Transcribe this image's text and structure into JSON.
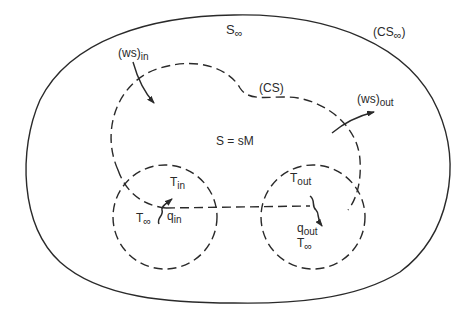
{
  "diagram": {
    "type": "control-surface-thermodynamics",
    "labels": {
      "s_inf": {
        "main": "S",
        "sub": "∞"
      },
      "cs_inf": {
        "open": "(CS",
        "sub": "∞",
        "close": ")"
      },
      "ws_in": {
        "main": "(ws)",
        "sub": "in"
      },
      "cs": "(CS)",
      "ws_out": {
        "main": "(ws)",
        "sub": "out"
      },
      "s_eq": "S = sM",
      "t_in": {
        "main": "T",
        "sub": "in"
      },
      "t_inf_left": {
        "main": "T",
        "sub": "∞"
      },
      "q_in": {
        "main": "q",
        "sub": "in"
      },
      "t_out": {
        "main": "T",
        "sub": "out"
      },
      "q_out": {
        "main": "q",
        "sub": "out"
      },
      "t_inf_right": {
        "main": "T",
        "sub": "∞"
      }
    },
    "elements": {
      "outer_boundary": "CS∞ (solid)",
      "control_surface": "CS (dashed)",
      "inlet_circle": "dashed circle at inlet",
      "outlet_circle": "dashed circle at outlet",
      "work_in_arrow": "(ws)in",
      "work_out_arrow": "(ws)out",
      "heat_in_arrow": "qin",
      "heat_out_arrow": "qout"
    },
    "colors": {
      "line": "#2a2a2a",
      "background": "#ffffff"
    }
  }
}
